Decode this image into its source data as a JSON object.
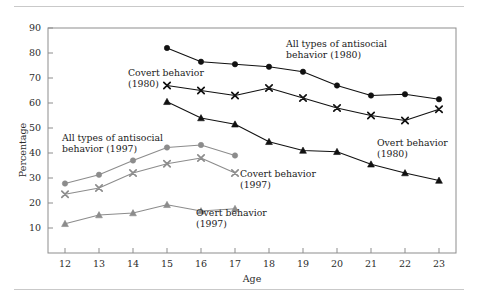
{
  "chart_data": {
    "type": "line",
    "title": "",
    "xlabel": "Age",
    "ylabel": "Percentage",
    "x": [
      12,
      13,
      14,
      15,
      16,
      17,
      18,
      19,
      20,
      21,
      22,
      23
    ],
    "xlim": [
      11.5,
      23.5
    ],
    "ylim": [
      0,
      90
    ],
    "yticks": [
      10,
      20,
      30,
      40,
      50,
      60,
      70,
      80,
      90
    ],
    "xticks": [
      "12",
      "13",
      "14",
      "15",
      "16",
      "17",
      "18",
      "19",
      "20",
      "21",
      "22",
      "23"
    ],
    "grid": false,
    "legend": "annotations-inline",
    "series": [
      {
        "name": "All types of antisocial behavior (1980)",
        "marker": "circle",
        "color": "#111111",
        "x": [
          15,
          16,
          17,
          18,
          19,
          20,
          21,
          22,
          23
        ],
        "values": [
          82,
          76.5,
          75.5,
          74.5,
          72.5,
          67,
          63,
          63.5,
          61.5
        ]
      },
      {
        "name": "Covert behavior (1980)",
        "marker": "cross",
        "color": "#111111",
        "x": [
          15,
          16,
          17,
          18,
          19,
          20,
          21,
          22,
          23
        ],
        "values": [
          67,
          65,
          63,
          66,
          62,
          58,
          55,
          53,
          57.5
        ]
      },
      {
        "name": "Overt behavior (1980)",
        "marker": "triangle",
        "color": "#111111",
        "x": [
          15,
          16,
          17,
          18,
          19,
          20,
          21,
          22,
          23
        ],
        "values": [
          60.5,
          54,
          51.5,
          44.5,
          41,
          40.5,
          35.5,
          32,
          29
        ]
      },
      {
        "name": "All types of antisocial behavior (1997)",
        "marker": "circle",
        "color": "#8c8c8c",
        "x": [
          12,
          13,
          14,
          15,
          16,
          17
        ],
        "values": [
          27.8,
          31.3,
          37,
          42.2,
          43.2,
          39
        ]
      },
      {
        "name": "Covert behavior (1997)",
        "marker": "cross",
        "color": "#8c8c8c",
        "x": [
          12,
          13,
          14,
          15,
          16,
          17
        ],
        "values": [
          23.5,
          26,
          32,
          35.7,
          38,
          32
        ]
      },
      {
        "name": "Overt behavior (1997)",
        "marker": "triangle",
        "color": "#8c8c8c",
        "x": [
          12,
          13,
          14,
          15,
          16,
          17
        ],
        "values": [
          11.7,
          15.2,
          16,
          19.3,
          16.8,
          17.7
        ]
      }
    ],
    "annotations": [
      {
        "id": "all-1980",
        "line1": "All types of antisocial",
        "line2": "behavior (1980)",
        "x": 286,
        "y": 47,
        "align": "start"
      },
      {
        "id": "covert-1980",
        "line1": "Covert behavior",
        "line2": "(1980)",
        "x": 128,
        "y": 76,
        "align": "start"
      },
      {
        "id": "overt-1980",
        "line1": "Overt behavior",
        "line2": "(1980)",
        "x": 377,
        "y": 146,
        "align": "start"
      },
      {
        "id": "all-1997",
        "line1": "All types of antisocial",
        "line2": "behavior (1997)",
        "x": 62,
        "y": 141,
        "align": "start"
      },
      {
        "id": "covert-1997",
        "line1": "Covert behavior",
        "line2": "(1997)",
        "x": 240,
        "y": 177,
        "align": "start"
      },
      {
        "id": "overt-1997",
        "line1": "Overt behavior",
        "line2": "(1997)",
        "x": 196,
        "y": 216,
        "align": "start"
      }
    ]
  },
  "figure": {
    "frame_color": "#8d8d8d",
    "rule_color": "#c9c9c9",
    "background": "#ffffff",
    "dark_series_color": "#111111",
    "light_series_color": "#8c8c8c"
  }
}
